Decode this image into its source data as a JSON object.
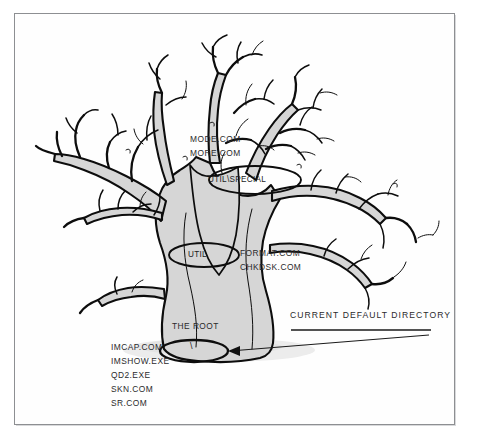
{
  "figure": {
    "kind": "hand-drawn-tree-illustration",
    "background_color": "#ffffff",
    "frame_color": "#8d8f92",
    "branch_outline_color": "#111111",
    "branch_fill_color": "#d7d7d7",
    "ground_shadow_color": "#e3e3e3"
  },
  "directories": {
    "root": {
      "oval_label": "\\",
      "caption": "THE ROOT",
      "files": [
        "IMCAP.COM",
        "IMSHOW.EXE",
        "QD2.EXE",
        "SKN.COM",
        "SR.COM"
      ]
    },
    "util": {
      "oval_label": "UTIL",
      "files": [
        "FORMAT.COM",
        "CHKDSK.COM"
      ]
    },
    "util_special": {
      "oval_label": "UTIL\\SPECIAL",
      "files": [
        "MODE.COM",
        "MORE.COM"
      ]
    }
  },
  "callout": {
    "label": "CURRENT DEFAULT DIRECTORY",
    "points_to": "root"
  }
}
